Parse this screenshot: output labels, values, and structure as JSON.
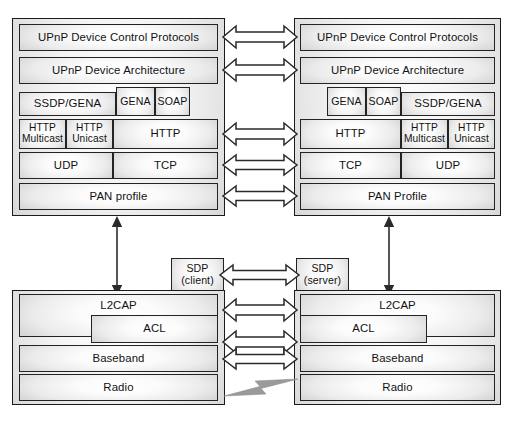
{
  "diagram": {
    "left_stack": {
      "name": "left-device-stack",
      "rows": {
        "dcp": "UPnP Device Control Protocols",
        "architecture": "UPnP Device Architecture",
        "ssdp_gena": "SSDP/GENA",
        "gena": "GENA",
        "soap": "SOAP",
        "http_multicast": "HTTP\nMulticast",
        "http_unicast": "HTTP\nUnicast",
        "http": "HTTP",
        "udp": "UDP",
        "tcp": "TCP",
        "pan_profile": "PAN profile"
      }
    },
    "right_stack": {
      "name": "right-device-stack",
      "rows": {
        "dcp": "UPnP Device Control Protocols",
        "architecture": "UPnP Device Architecture",
        "gena": "GENA",
        "soap": "SOAP",
        "ssdp_gena": "SSDP/GENA",
        "http": "HTTP",
        "http_multicast": "HTTP\nMulticast",
        "http_unicast": "HTTP\nUnicast",
        "tcp": "TCP",
        "udp": "UDP",
        "pan_profile": "PAN Profile"
      }
    },
    "left_bluetooth": {
      "name": "left-bluetooth-stack",
      "rows": {
        "l2cap": "L2CAP",
        "acl": "ACL",
        "baseband": "Baseband",
        "radio": "Radio"
      }
    },
    "right_bluetooth": {
      "name": "right-bluetooth-stack",
      "rows": {
        "l2cap": "L2CAP",
        "acl": "ACL",
        "baseband": "Baseband",
        "radio": "Radio"
      }
    },
    "sdp": {
      "client": "SDP\n(client)",
      "server": "SDP\n(server)"
    },
    "colors": {
      "stroke": "#1b1b1b",
      "arrow_fill": "#ffffff",
      "arrow_stroke": "#2a2a2a",
      "bolt": "#9a9a9a",
      "background": "#ffffff"
    }
  }
}
